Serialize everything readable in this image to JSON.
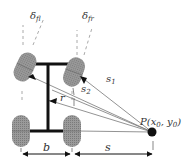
{
  "diagram": {
    "labels": {
      "delta_fl": "δ",
      "delta_fl_sub": "fl",
      "delta_fr": "δ",
      "delta_fr_sub": "fr",
      "s1": "s",
      "s1_sub": "1",
      "s2": "s",
      "s2_sub": "2",
      "r": "r",
      "point": "P(x",
      "point_x_sub": "0",
      "point_sep": ", y",
      "point_y_sub": "0",
      "point_close": ")",
      "b": "b",
      "s": "s"
    },
    "colors": {
      "wheel_fill": "#8a8a8a",
      "frame": "#111111",
      "line": "#666666",
      "dash": "#999999",
      "point": "#111111",
      "text": "#333333"
    }
  }
}
